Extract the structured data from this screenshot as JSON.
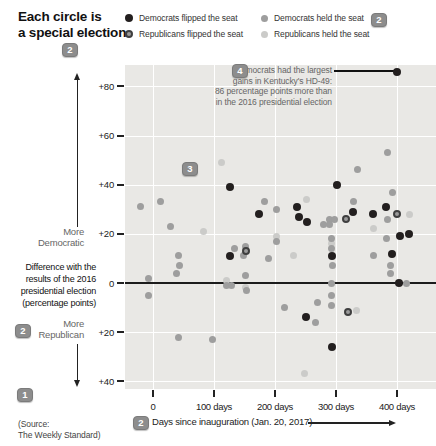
{
  "header": {
    "title_line1": "Each circle is",
    "title_line2": "a special election"
  },
  "legend": {
    "items": [
      {
        "key": "dem_flip",
        "label": "Democrats flipped the seat",
        "color": "#231f1f"
      },
      {
        "key": "rep_flip",
        "label": "Republicans flipped the seat",
        "color": "#9a9a9a",
        "ring_color": "#3f3f3f"
      },
      {
        "key": "dem_held",
        "label": "Democrats held the seat",
        "color": "#9e9e9e"
      },
      {
        "key": "rep_held",
        "label": "Republicans held the seat",
        "color": "#cbcbc9"
      }
    ]
  },
  "badges": [
    {
      "label": "2"
    },
    {
      "label": "2"
    },
    {
      "label": "4"
    },
    {
      "label": "3"
    },
    {
      "label": "2"
    },
    {
      "label": "1"
    },
    {
      "label": "2"
    }
  ],
  "annotation": {
    "line1": "Democrats had the largest",
    "line2": "gains in Kentucky's HD-49:",
    "line3": "86 percentage points more than",
    "line4": "in the 2016 presidential election"
  },
  "axis_left": {
    "more_democratic_line1": "More",
    "more_democratic_line2": "Democratic",
    "desc_line1": "Difference with the",
    "desc_line2": "results of the 2016",
    "desc_line3": "presidential election",
    "desc_line4": "(percentage points)",
    "more_republican_line1": "More",
    "more_republican_line2": "Republican",
    "tick_labels": [
      "+80",
      "+60",
      "+40",
      "+20",
      "0",
      "+20",
      "+40"
    ]
  },
  "x_axis": {
    "tick_labels": [
      "0",
      "100 days",
      "200 days",
      "300 days",
      "400 days"
    ],
    "title": "Days since inauguration (Jan. 20, 2017)"
  },
  "source": {
    "line1": "(Source:",
    "line2": "The Weekly Standard)"
  },
  "chart_data": {
    "type": "scatter",
    "title": "Each circle is a special election",
    "xlabel": "Days since inauguration (Jan. 20, 2017)",
    "ylabel": "Difference with the results of the 2016 presidential election (percentage points)",
    "x_ticks_days": [
      0,
      100,
      200,
      300,
      400
    ],
    "y_ticks_points": [
      80,
      60,
      40,
      20,
      0,
      -20,
      -40
    ],
    "xlim_days": [
      -46,
      464
    ],
    "ylim_points": [
      -43,
      89
    ],
    "grid": true,
    "plot_background": "#e9e8e5",
    "annotation": {
      "text": "Democrats had the largest gains in Kentucky's HD-49: 86 percentage points more than in the 2016 presidential election",
      "target_days": 400,
      "target_points": 86
    },
    "series": [
      {
        "name": "Democrats flipped the seat",
        "key": "dem_flip",
        "color": "#231f1f",
        "points": [
          [
            400,
            86
          ],
          [
            126,
            39
          ],
          [
            302,
            40
          ],
          [
            174,
            28
          ],
          [
            236,
            31
          ],
          [
            239,
            27
          ],
          [
            252,
            25
          ],
          [
            328,
            29
          ],
          [
            361,
            28
          ],
          [
            382,
            31
          ],
          [
            293,
            11
          ],
          [
            126,
            11
          ],
          [
            405,
            19
          ],
          [
            419,
            20
          ],
          [
            392,
            12
          ],
          [
            251,
            -14
          ],
          [
            293,
            -26
          ],
          [
            403,
            0
          ]
        ]
      },
      {
        "name": "Republicans flipped the seat",
        "key": "rep_flip",
        "color": "#9a9a9a",
        "ring_color": "#3f3f3f",
        "points": [
          [
            316,
            26
          ],
          [
            152,
            13
          ],
          [
            320,
            -12
          ],
          [
            400,
            28
          ]
        ]
      },
      {
        "name": "Democrats held the seat",
        "key": "dem_held",
        "color": "#9e9e9e",
        "points": [
          [
            384,
            53
          ],
          [
            336,
            46
          ],
          [
            392,
            37
          ],
          [
            13,
            33
          ],
          [
            -21,
            31
          ],
          [
            182,
            33
          ],
          [
            203,
            30
          ],
          [
            328,
            33
          ],
          [
            28,
            23
          ],
          [
            279,
            24
          ],
          [
            290,
            26
          ],
          [
            297,
            26
          ],
          [
            290,
            24
          ],
          [
            293,
            18
          ],
          [
            293,
            14
          ],
          [
            295,
            7
          ],
          [
            361,
            11
          ],
          [
            384,
            26
          ],
          [
            382,
            18
          ],
          [
            390,
            7
          ],
          [
            389,
            4
          ],
          [
            41,
            11
          ],
          [
            43,
            7
          ],
          [
            134,
            14
          ],
          [
            151,
            15
          ],
          [
            148,
            11
          ],
          [
            189,
            10
          ],
          [
            38,
            4
          ],
          [
            151,
            3
          ],
          [
            -8,
            2
          ],
          [
            121,
            -1
          ],
          [
            128,
            -1
          ],
          [
            -8,
            -5
          ],
          [
            154,
            -3
          ],
          [
            215,
            -10
          ],
          [
            41,
            -22
          ],
          [
            97,
            -23
          ],
          [
            270,
            -8
          ],
          [
            293,
            0
          ],
          [
            293,
            -5
          ],
          [
            293,
            -9
          ],
          [
            266,
            -16
          ],
          [
            416,
            0
          ],
          [
            202,
            17
          ]
        ]
      },
      {
        "name": "Republicans held the seat",
        "key": "rep_held",
        "color": "#cbcbc9",
        "points": [
          [
            113,
            49
          ],
          [
            252,
            34
          ],
          [
            82,
            21
          ],
          [
            202,
            19
          ],
          [
            361,
            22
          ],
          [
            230,
            11
          ],
          [
            121,
            1
          ],
          [
            151,
            -2
          ],
          [
            334,
            -11
          ],
          [
            249,
            -37
          ],
          [
            420,
            28
          ],
          [
            293,
            16
          ]
        ]
      }
    ]
  }
}
